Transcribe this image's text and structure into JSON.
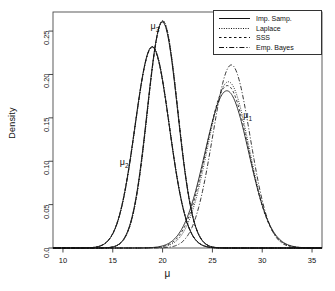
{
  "chart_data": {
    "type": "line",
    "title": "",
    "xlabel": "μ",
    "ylabel": "Density",
    "xlim": [
      9,
      36
    ],
    "ylim": [
      0.0,
      0.272
    ],
    "grid": false,
    "legend_position": "top-right",
    "xticks": [
      "10",
      "15",
      "20",
      "25",
      "30",
      "35"
    ],
    "xtick_values": [
      10,
      15,
      20,
      25,
      30,
      35
    ],
    "yticks": [
      "0.0",
      "0.05",
      "0.10",
      "0.15",
      "0.20",
      "0.25"
    ],
    "ytick_values": [
      0.0,
      0.05,
      0.1,
      0.15,
      0.2,
      0.25
    ],
    "legend": [
      {
        "name": "Imp. Samp.",
        "style": "solid"
      },
      {
        "name": "Laplace",
        "style": "dotted"
      },
      {
        "name": "SSS",
        "style": "dashed"
      },
      {
        "name": "Emp. Bayes",
        "style": "dashdot"
      }
    ],
    "annotations": [
      {
        "text": "μ",
        "sub": "1",
        "x": 28.6,
        "y": 0.152
      },
      {
        "text": "μ",
        "sub": "2",
        "x": 16.2,
        "y": 0.098
      },
      {
        "text": "μ",
        "sub": "3",
        "x": 19.3,
        "y": 0.255
      }
    ],
    "groups": [
      {
        "label": "mu_1",
        "series": [
          {
            "name": "Imp. Samp.",
            "style": "solid",
            "mean": 26.45,
            "sd": 2.2,
            "peak": 0.1812
          },
          {
            "name": "Laplace",
            "style": "dotted",
            "mean": 26.6,
            "sd": 2.08,
            "peak": 0.1916
          },
          {
            "name": "SSS",
            "style": "dashed",
            "mean": 26.5,
            "sd": 2.13,
            "peak": 0.1872
          },
          {
            "name": "Emp. Bayes",
            "style": "dashdot",
            "mean": 26.9,
            "sd": 1.89,
            "peak": 0.211
          }
        ]
      },
      {
        "label": "mu_2",
        "series": [
          {
            "name": "Imp. Samp.",
            "style": "solid",
            "mean": 18.95,
            "sd": 1.72,
            "peak": 0.232
          },
          {
            "name": "Laplace",
            "style": "dotted",
            "mean": 18.98,
            "sd": 1.72,
            "peak": 0.2322
          },
          {
            "name": "SSS",
            "style": "dashed",
            "mean": 18.95,
            "sd": 1.73,
            "peak": 0.231
          },
          {
            "name": "Emp. Bayes",
            "style": "dashdot",
            "mean": 18.96,
            "sd": 1.72,
            "peak": 0.2318
          }
        ]
      },
      {
        "label": "mu_3",
        "series": [
          {
            "name": "Imp. Samp.",
            "style": "solid",
            "mean": 19.98,
            "sd": 1.53,
            "peak": 0.2605
          },
          {
            "name": "Laplace",
            "style": "dotted",
            "mean": 20.02,
            "sd": 1.52,
            "peak": 0.2622
          },
          {
            "name": "SSS",
            "style": "dashed",
            "mean": 20.0,
            "sd": 1.52,
            "peak": 0.2618
          },
          {
            "name": "Emp. Bayes",
            "style": "dashdot",
            "mean": 20.0,
            "sd": 1.53,
            "peak": 0.261
          }
        ]
      }
    ]
  },
  "axes": {
    "ylabel": "Density",
    "xlabel": "μ"
  },
  "legend": {
    "items": [
      {
        "label": "Imp. Samp."
      },
      {
        "label": "Laplace"
      },
      {
        "label": "SSS"
      },
      {
        "label": "Emp. Bayes"
      }
    ]
  },
  "xticks": [
    {
      "label": "10"
    },
    {
      "label": "15"
    },
    {
      "label": "20"
    },
    {
      "label": "25"
    },
    {
      "label": "30"
    },
    {
      "label": "35"
    }
  ],
  "yticks": [
    {
      "label": "0.0"
    },
    {
      "label": "0.05"
    },
    {
      "label": "0.10"
    },
    {
      "label": "0.15"
    },
    {
      "label": "0.20"
    },
    {
      "label": "0.25"
    }
  ],
  "annotations": [
    {
      "base": "μ",
      "sub": "1"
    },
    {
      "base": "μ",
      "sub": "2"
    },
    {
      "base": "μ",
      "sub": "3"
    }
  ]
}
